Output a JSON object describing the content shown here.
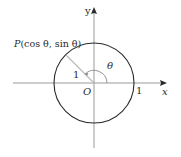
{
  "diagram": {
    "type": "unit-circle",
    "labels": {
      "y_axis": "y",
      "x_axis": "x",
      "origin": "O",
      "x_intercept": "1",
      "radius": "1",
      "angle": "θ",
      "point_prefix": "P",
      "point_coords": "(cos θ, sin θ)"
    },
    "geometry": {
      "center": [
        94,
        83
      ],
      "radius": 40,
      "point_angle_deg": 135,
      "angle_arc_radius": 13
    },
    "colors": {
      "axis": "#9a9a9a",
      "circle": "#2a2a2a",
      "radius_line": "#bdbdbd",
      "angle_arc": "#8a8a8a",
      "text": "#2a2a2a"
    }
  }
}
